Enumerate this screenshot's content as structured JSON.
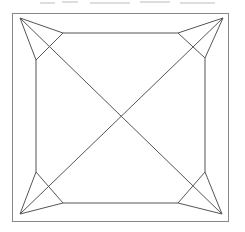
{
  "header": {
    "clipped_text": "",
    "note": "partially visible line of text cut off at top edge"
  },
  "diagram": {
    "type": "geometric-figure",
    "stroke_color": "#555555",
    "border_color": "#888888",
    "outer_square": {
      "x1": 12,
      "y1": 13,
      "x2": 229,
      "y2": 222
    },
    "apexes": {
      "top_left": [
        20,
        18
      ],
      "top_right": [
        223,
        18
      ],
      "bottom_left": [
        20,
        214
      ],
      "bottom_right": [
        222,
        214
      ]
    },
    "inner_octagon": [
      [
        63,
        33
      ],
      [
        178,
        33
      ],
      [
        205,
        58
      ],
      [
        205,
        172
      ],
      [
        178,
        203
      ],
      [
        63,
        203
      ],
      [
        36,
        172
      ],
      [
        36,
        60
      ]
    ],
    "center_crossing": [
      121,
      116
    ]
  }
}
